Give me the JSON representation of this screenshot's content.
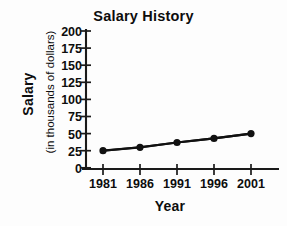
{
  "chart_data": {
    "type": "line",
    "title": "Salary History",
    "xlabel": "Year",
    "ylabel": "Salary",
    "ylabel_sub": "(in thousands of dollars)",
    "categories": [
      "1981",
      "1986",
      "1991",
      "1996",
      "2001"
    ],
    "x": [
      1981,
      1986,
      1991,
      1996,
      2001
    ],
    "values": [
      25,
      30,
      37,
      43,
      50
    ],
    "series": [
      {
        "name": "Salary",
        "values": [
          25,
          30,
          37,
          43,
          50
        ]
      }
    ],
    "ylim": [
      0,
      200
    ],
    "yticks": [
      0,
      25,
      50,
      75,
      100,
      125,
      150,
      175,
      200
    ],
    "ytick_labels": [
      "0",
      "25",
      "50",
      "75",
      "100",
      "125",
      "150",
      "175",
      "200"
    ],
    "xticks": [
      1981,
      1986,
      1991,
      1996,
      2001
    ],
    "xtick_labels": [
      "1981",
      "1986",
      "1991",
      "1996",
      "2001"
    ],
    "grid": false,
    "legend": "none",
    "line_color": "#111111",
    "marker_color": "#111111",
    "axis_color": "#1a1a1a",
    "background_color": "#fdfdfd"
  }
}
